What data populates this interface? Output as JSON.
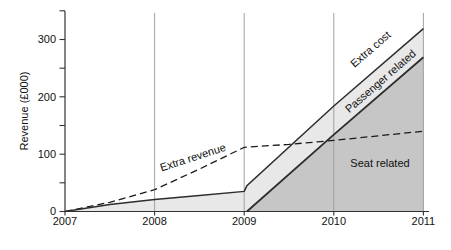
{
  "chart_data": {
    "type": "area",
    "title": "",
    "xlabel": "",
    "ylabel": "Revenue (£000)",
    "xlim": [
      2007,
      2011
    ],
    "ylim": [
      0,
      350
    ],
    "x_ticks": [
      "2007",
      "2008",
      "2009",
      "2010",
      "2011"
    ],
    "y_ticks": [
      0,
      100,
      200,
      300
    ],
    "y_minor_tick_step": 50,
    "grid": "vertical gridline at each year tick",
    "legend_position": "none (labels placed inline on chart)",
    "series": [
      {
        "name": "Extra revenue",
        "kind": "line",
        "style": "dashed",
        "color": "#1a1a1a",
        "points": [
          [
            2007,
            0
          ],
          [
            2007.5,
            16
          ],
          [
            2008,
            38
          ],
          [
            2008.5,
            74
          ],
          [
            2009,
            112
          ],
          [
            2009.5,
            117
          ],
          [
            2010,
            124
          ],
          [
            2010.5,
            132
          ],
          [
            2011,
            140
          ]
        ]
      },
      {
        "name": "Extra cost",
        "kind": "area",
        "style": "solid",
        "fill": "#e8e8e8",
        "color": "#2d2d2d",
        "points": [
          [
            2007,
            0
          ],
          [
            2007.5,
            12
          ],
          [
            2008,
            21
          ],
          [
            2008.5,
            28
          ],
          [
            2009,
            35
          ],
          [
            2009.03,
            45
          ],
          [
            2010,
            184
          ],
          [
            2011,
            319
          ]
        ]
      },
      {
        "name": "Seat related",
        "kind": "area",
        "style": "solid",
        "fill": "#c6c6c6",
        "color": "#2d2d2d",
        "points": [
          [
            2009.03,
            0
          ],
          [
            2010,
            134
          ],
          [
            2011,
            269
          ]
        ]
      }
    ],
    "annotations": {
      "extra_revenue": "Extra revenue",
      "extra_cost": "Extra cost",
      "passenger_related": "Passenger related",
      "seat_related": "Seat related"
    },
    "colors": {
      "light_area": "#e8e8e8",
      "dark_area": "#c6c6c6",
      "line": "#2d2d2d",
      "dashed_line": "#1a1a1a",
      "grid": "#999999",
      "axis": "#333333",
      "text": "#111111"
    }
  }
}
